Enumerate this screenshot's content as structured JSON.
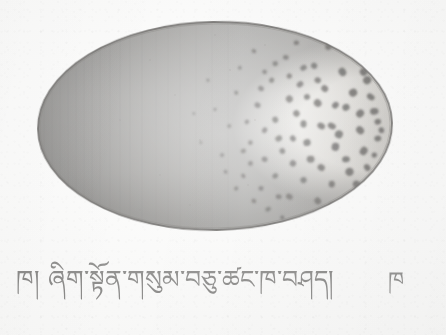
{
  "document": {
    "kind": "scanned-illustration",
    "page_background_color": "#fdfdfc",
    "ink_color": "#4e4d4b"
  },
  "figure": {
    "name": "speckled-egg-illustration",
    "shape": "ellipse",
    "description_label": "speckled egg",
    "outline_color": "#3a3835",
    "geometry": {
      "center_x": 215,
      "center_y": 126,
      "radius_x": 177,
      "radius_y": 104,
      "rotation_deg": -1
    },
    "shading": {
      "left_tone": "#9a9894",
      "mid_tone": "#cfcdc8",
      "highlight_tone": "#f3f2ef",
      "right_tone": "#bdbab4"
    },
    "spots": {
      "color": "#3b3936",
      "count": 86,
      "distribution": "clustered-right",
      "points": [
        [
          0.66,
          0.28,
          3.2
        ],
        [
          0.7,
          0.17,
          3.0
        ],
        [
          0.74,
          0.3,
          3.4
        ],
        [
          0.78,
          0.21,
          3.6
        ],
        [
          0.82,
          0.12,
          3.2
        ],
        [
          0.86,
          0.24,
          4.0
        ],
        [
          0.9,
          0.16,
          3.4
        ],
        [
          0.93,
          0.28,
          4.2
        ],
        [
          0.62,
          0.4,
          2.8
        ],
        [
          0.67,
          0.47,
          3.2
        ],
        [
          0.71,
          0.37,
          3.4
        ],
        [
          0.75,
          0.49,
          3.6
        ],
        [
          0.79,
          0.39,
          3.8
        ],
        [
          0.83,
          0.5,
          4.0
        ],
        [
          0.87,
          0.41,
          4.2
        ],
        [
          0.91,
          0.52,
          4.4
        ],
        [
          0.95,
          0.43,
          4.0
        ],
        [
          0.6,
          0.58,
          2.6
        ],
        [
          0.64,
          0.66,
          3.0
        ],
        [
          0.68,
          0.56,
          3.2
        ],
        [
          0.72,
          0.68,
          3.4
        ],
        [
          0.76,
          0.58,
          3.6
        ],
        [
          0.8,
          0.7,
          3.8
        ],
        [
          0.84,
          0.6,
          4.0
        ],
        [
          0.88,
          0.72,
          4.0
        ],
        [
          0.92,
          0.62,
          4.2
        ],
        [
          0.96,
          0.56,
          3.6
        ],
        [
          0.58,
          0.74,
          2.4
        ],
        [
          0.63,
          0.8,
          2.8
        ],
        [
          0.67,
          0.74,
          3.0
        ],
        [
          0.71,
          0.84,
          3.2
        ],
        [
          0.75,
          0.76,
          3.4
        ],
        [
          0.79,
          0.86,
          3.4
        ],
        [
          0.83,
          0.78,
          3.6
        ],
        [
          0.87,
          0.88,
          3.4
        ],
        [
          0.9,
          0.78,
          3.6
        ],
        [
          0.56,
          0.34,
          2.2
        ],
        [
          0.54,
          0.5,
          2.0
        ],
        [
          0.52,
          0.64,
          1.9
        ],
        [
          0.57,
          0.22,
          2.2
        ],
        [
          0.61,
          0.14,
          2.4
        ],
        [
          0.65,
          0.9,
          2.6
        ],
        [
          0.69,
          0.94,
          2.4
        ],
        [
          0.73,
          0.1,
          2.6
        ],
        [
          0.77,
          0.06,
          2.4
        ],
        [
          0.81,
          0.94,
          2.6
        ],
        [
          0.85,
          0.06,
          2.8
        ],
        [
          0.89,
          0.95,
          2.6
        ],
        [
          0.5,
          0.42,
          1.7
        ],
        [
          0.48,
          0.28,
          1.6
        ],
        [
          0.46,
          0.58,
          1.5
        ],
        [
          0.44,
          0.44,
          1.4
        ],
        [
          0.94,
          0.36,
          3.8
        ],
        [
          0.96,
          0.48,
          3.6
        ],
        [
          0.93,
          0.7,
          3.6
        ],
        [
          0.95,
          0.64,
          3.2
        ],
        [
          0.59,
          0.48,
          2.5
        ],
        [
          0.63,
          0.32,
          2.8
        ],
        [
          0.69,
          0.62,
          3.2
        ],
        [
          0.73,
          0.44,
          3.4
        ],
        [
          0.77,
          0.66,
          3.6
        ],
        [
          0.81,
          0.32,
          3.6
        ],
        [
          0.85,
          0.54,
          4.0
        ],
        [
          0.89,
          0.34,
          3.8
        ],
        [
          0.91,
          0.44,
          4.0
        ],
        [
          0.87,
          0.66,
          3.8
        ],
        [
          0.83,
          0.88,
          3.2
        ],
        [
          0.79,
          0.28,
          3.4
        ],
        [
          0.75,
          0.22,
          3.2
        ],
        [
          0.71,
          0.26,
          3.0
        ],
        [
          0.67,
          0.2,
          2.8
        ],
        [
          0.64,
          0.52,
          2.8
        ],
        [
          0.6,
          0.68,
          2.6
        ],
        [
          0.56,
          0.8,
          2.2
        ],
        [
          0.53,
          0.72,
          1.9
        ],
        [
          0.97,
          0.52,
          3.0
        ],
        [
          0.92,
          0.24,
          3.8
        ],
        [
          0.88,
          0.14,
          3.2
        ],
        [
          0.84,
          0.4,
          3.8
        ],
        [
          0.8,
          0.5,
          3.8
        ],
        [
          0.76,
          0.36,
          3.4
        ],
        [
          0.72,
          0.56,
          3.2
        ],
        [
          0.68,
          0.84,
          2.8
        ],
        [
          0.64,
          0.24,
          2.6
        ],
        [
          0.61,
          0.86,
          2.4
        ],
        [
          0.58,
          0.62,
          2.4
        ]
      ]
    }
  },
  "caption": {
    "main_text": "ཁ། ཞིག་སྟོན་གསུམ་བཅུ་ཚང་ཁ་བཤད།",
    "right_text": "ཁ",
    "script": "Tibetan",
    "main_left_px": 16,
    "main_top_px": 251,
    "right_left_px": 388,
    "right_top_px": 254
  }
}
